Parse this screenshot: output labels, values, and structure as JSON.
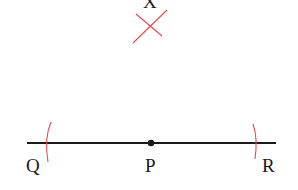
{
  "diagram": {
    "points": {
      "X": {
        "label": "X"
      },
      "Q": {
        "label": "Q"
      },
      "P": {
        "label": "P"
      },
      "R": {
        "label": "R"
      }
    },
    "colors": {
      "line": "#1a1a1a",
      "arc": "#e8484a"
    }
  }
}
